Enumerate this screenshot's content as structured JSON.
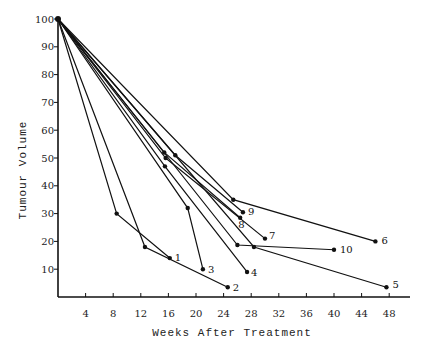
{
  "chart_data": {
    "type": "line",
    "title": "",
    "xlabel": "Weeks After Treatment",
    "ylabel": "Tumour Volume",
    "xlim": [
      0,
      50
    ],
    "ylim": [
      0,
      100
    ],
    "x_ticks": [
      4,
      8,
      12,
      16,
      20,
      24,
      28,
      32,
      36,
      40,
      44,
      48
    ],
    "y_ticks": [
      10,
      20,
      30,
      40,
      50,
      60,
      70,
      80,
      90,
      100
    ],
    "grid": false,
    "legend": "none (series labelled at line ends 1-10)",
    "series": [
      {
        "name": "1",
        "points": [
          [
            0,
            100
          ],
          [
            8.5,
            30
          ],
          [
            16.2,
            14
          ]
        ]
      },
      {
        "name": "2",
        "points": [
          [
            0,
            100
          ],
          [
            12.6,
            18
          ],
          [
            24.6,
            3.5
          ]
        ]
      },
      {
        "name": "3",
        "points": [
          [
            0,
            100
          ],
          [
            18.8,
            32
          ],
          [
            21,
            10
          ]
        ]
      },
      {
        "name": "4",
        "points": [
          [
            0,
            100
          ],
          [
            15.5,
            47
          ],
          [
            27.4,
            9
          ]
        ]
      },
      {
        "name": "5",
        "points": [
          [
            0,
            100
          ],
          [
            28.4,
            18
          ],
          [
            47.6,
            3.5
          ]
        ]
      },
      {
        "name": "6",
        "points": [
          [
            0,
            100
          ],
          [
            25.4,
            35
          ],
          [
            46,
            20
          ]
        ]
      },
      {
        "name": "7",
        "points": [
          [
            0,
            100
          ],
          [
            15.6,
            50
          ],
          [
            30,
            21
          ]
        ]
      },
      {
        "name": "8",
        "points": [
          [
            0,
            100
          ],
          [
            15.4,
            52
          ],
          [
            26.4,
            28.5
          ]
        ]
      },
      {
        "name": "9",
        "points": [
          [
            0,
            100
          ],
          [
            17,
            51
          ],
          [
            26.8,
            30.5
          ]
        ]
      },
      {
        "name": "10",
        "points": [
          [
            0,
            100
          ],
          [
            26,
            18.7
          ],
          [
            40,
            17
          ]
        ]
      }
    ]
  }
}
